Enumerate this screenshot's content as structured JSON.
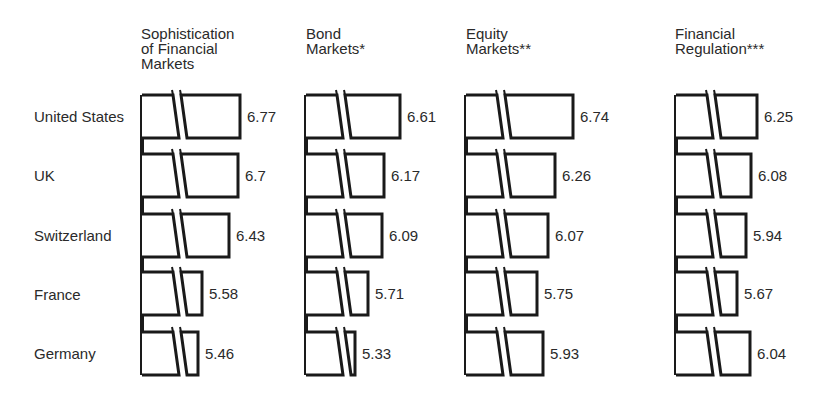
{
  "chart_data": {
    "type": "bar",
    "orientation": "horizontal",
    "axis_break": true,
    "categories": [
      "United States",
      "UK",
      "Switzerland",
      "France",
      "Germany"
    ],
    "series": [
      {
        "name": "Sophistication of Financial Markets",
        "values": [
          6.77,
          6.7,
          6.43,
          5.58,
          5.46
        ]
      },
      {
        "name": "Bond Markets*",
        "values": [
          6.61,
          6.17,
          6.09,
          5.71,
          5.33
        ]
      },
      {
        "name": "Equity Markets**",
        "values": [
          6.74,
          6.26,
          6.07,
          5.75,
          5.93
        ]
      },
      {
        "name": "Financial Regulation***",
        "values": [
          6.25,
          6.08,
          5.94,
          5.67,
          6.04
        ]
      }
    ],
    "value_labels": [
      [
        "6.77",
        "6.7",
        "6.43",
        "5.58",
        "5.46"
      ],
      [
        "6.61",
        "6.17",
        "6.09",
        "5.71",
        "5.33"
      ],
      [
        "6.74",
        "6.26",
        "6.07",
        "5.75",
        "5.93"
      ],
      [
        "6.25",
        "6.08",
        "5.94",
        "5.67",
        "6.04"
      ]
    ],
    "panel_titles": [
      "Sophistication\nof Financial\nMarkets",
      "Bond\nMarkets*",
      "Equity\nMarkets**",
      "Financial\nRegulation***"
    ],
    "title": "",
    "xlabel": "",
    "ylabel": "",
    "grid": false,
    "legend": "none"
  },
  "rows": {
    "labels": [
      "United States",
      "UK",
      "Switzerland",
      "France",
      "Germany"
    ]
  },
  "panels": [
    {
      "title": "Sophistication\nof Financial\nMarkets"
    },
    {
      "title": "Bond\nMarkets*"
    },
    {
      "title": "Equity\nMarkets**"
    },
    {
      "title": "Financial\nRegulation***"
    }
  ],
  "colors": {
    "outline": "#1a1a1a",
    "fill": "#ffffff",
    "text": "#2a2a2a"
  }
}
